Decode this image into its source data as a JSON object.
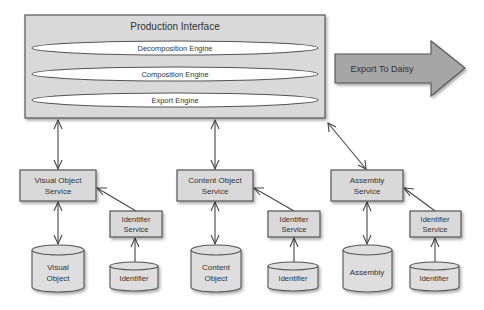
{
  "diagram": {
    "production_interface": {
      "title": "Production Interface",
      "engines": [
        {
          "id": "decomposition",
          "label": "Decomposition Engine"
        },
        {
          "id": "composition",
          "label": "Composition Engine"
        },
        {
          "id": "export",
          "label": "Export Engine"
        }
      ]
    },
    "export_arrow": {
      "label": "Export To Daisy"
    },
    "services": [
      {
        "id": "visual-object-service",
        "lines": [
          "Visual Object",
          "Service"
        ]
      },
      {
        "id": "content-object-service",
        "lines": [
          "Content Object",
          "Service"
        ]
      },
      {
        "id": "assembly-service",
        "lines": [
          "Assembly",
          "Service"
        ]
      }
    ],
    "identifier_services": [
      {
        "id": "identifier-service-1",
        "lines": [
          "Identifier",
          "Service"
        ]
      },
      {
        "id": "identifier-service-2",
        "lines": [
          "Identifier",
          "Service"
        ]
      },
      {
        "id": "identifier-service-3",
        "lines": [
          "Identifier",
          "Service"
        ]
      }
    ],
    "stores": [
      {
        "id": "visual-object-store",
        "lines": [
          "Visual",
          "Object"
        ]
      },
      {
        "id": "content-object-store",
        "lines": [
          "Content",
          "Object"
        ]
      },
      {
        "id": "assembly-store",
        "lines": [
          "Assembly"
        ]
      }
    ],
    "identifier_stores": [
      {
        "id": "identifier-store-1",
        "lines": [
          "Identifier"
        ]
      },
      {
        "id": "identifier-store-2",
        "lines": [
          "Identifier"
        ]
      },
      {
        "id": "identifier-store-3",
        "lines": [
          "Identifier"
        ]
      }
    ],
    "connections": [
      {
        "from": "production-interface",
        "to": "visual-object-service",
        "type": "bidirectional"
      },
      {
        "from": "production-interface",
        "to": "content-object-service",
        "type": "bidirectional"
      },
      {
        "from": "production-interface",
        "to": "assembly-service",
        "type": "bidirectional"
      },
      {
        "from": "visual-object-service",
        "to": "visual-object-store",
        "type": "bidirectional"
      },
      {
        "from": "content-object-service",
        "to": "content-object-store",
        "type": "bidirectional"
      },
      {
        "from": "assembly-service",
        "to": "assembly-store",
        "type": "bidirectional"
      },
      {
        "from": "identifier-service-1",
        "to": "visual-object-service",
        "type": "directed"
      },
      {
        "from": "identifier-service-2",
        "to": "content-object-service",
        "type": "directed"
      },
      {
        "from": "identifier-service-3",
        "to": "assembly-service",
        "type": "directed"
      },
      {
        "from": "identifier-store-1",
        "to": "identifier-service-1",
        "type": "directed"
      },
      {
        "from": "identifier-store-2",
        "to": "identifier-service-2",
        "type": "directed"
      },
      {
        "from": "identifier-store-3",
        "to": "identifier-service-3",
        "type": "directed"
      }
    ]
  }
}
